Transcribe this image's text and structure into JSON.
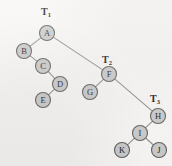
{
  "figure": {
    "background_color": "#f7f6f4",
    "node_fill_color": "#c9c9c9",
    "node_stroke_color": "#5d5d5d",
    "edge_color": "#8d8d8d",
    "label_color": "#111111"
  },
  "nodes": [
    {
      "id": "A",
      "label": "A",
      "x": 47,
      "y": 33,
      "r": 7.5
    },
    {
      "id": "B",
      "label": "B",
      "x": 24,
      "y": 51,
      "r": 7.5
    },
    {
      "id": "C",
      "label": "C",
      "x": 43,
      "y": 66,
      "r": 7.5
    },
    {
      "id": "D",
      "label": "D",
      "x": 60,
      "y": 84,
      "r": 7.5
    },
    {
      "id": "E",
      "label": "E",
      "x": 43,
      "y": 100,
      "r": 7.5
    },
    {
      "id": "F",
      "label": "F",
      "x": 109,
      "y": 74,
      "r": 7.5
    },
    {
      "id": "G",
      "label": "G",
      "x": 90,
      "y": 92,
      "r": 7.5
    },
    {
      "id": "H",
      "label": "H",
      "x": 158,
      "y": 116,
      "r": 7.5
    },
    {
      "id": "I",
      "label": "I",
      "x": 140,
      "y": 133,
      "r": 7.5
    },
    {
      "id": "K",
      "label": "K",
      "x": 122,
      "y": 150,
      "r": 7.5
    },
    {
      "id": "J",
      "label": "J",
      "x": 159,
      "y": 150,
      "r": 7.5
    }
  ],
  "edges": [
    {
      "from": "A",
      "to": "B"
    },
    {
      "from": "A",
      "to": "F"
    },
    {
      "from": "B",
      "to": "C"
    },
    {
      "from": "C",
      "to": "D"
    },
    {
      "from": "D",
      "to": "E"
    },
    {
      "from": "F",
      "to": "G"
    },
    {
      "from": "F",
      "to": "H"
    },
    {
      "from": "H",
      "to": "I"
    },
    {
      "from": "I",
      "to": "K"
    },
    {
      "from": "I",
      "to": "J"
    }
  ],
  "tree_labels": [
    {
      "id": "T1",
      "base": "T",
      "subscript": "1",
      "x": 46,
      "y": 15,
      "for_node": "A"
    },
    {
      "id": "T2",
      "base": "T",
      "subscript": "2",
      "x": 107,
      "y": 63,
      "for_node": "F"
    },
    {
      "id": "T3",
      "base": "T",
      "subscript": "3",
      "x": 155,
      "y": 102,
      "for_node": "H"
    }
  ]
}
